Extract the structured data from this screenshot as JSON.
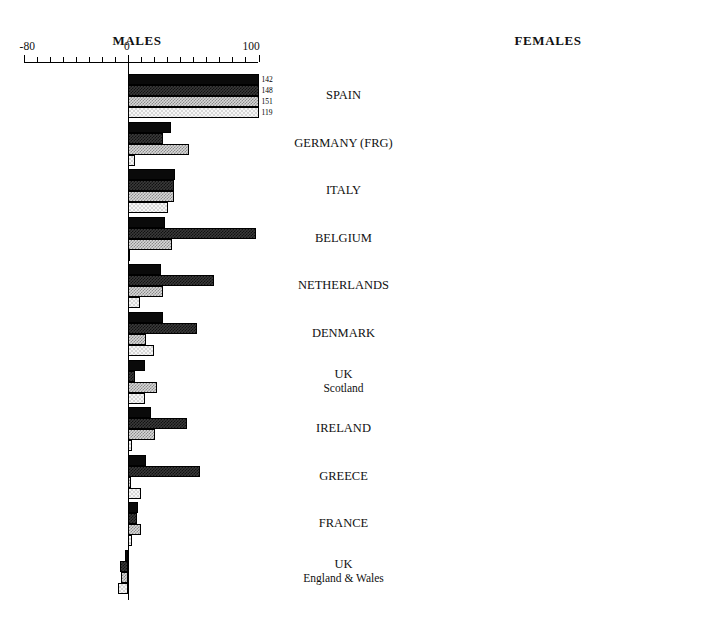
{
  "chart_data": {
    "type": "bar",
    "title": "",
    "orientation": "horizontal-diverging",
    "panels": [
      {
        "key": "males",
        "label": "MALES"
      },
      {
        "key": "females",
        "label": "FEMALES"
      }
    ],
    "xlabel": "",
    "ylabel": "",
    "xlim": [
      -80,
      100
    ],
    "xticks": [
      -80,
      -70,
      -60,
      -50,
      -40,
      -30,
      -20,
      -10,
      0,
      10,
      20,
      30,
      40,
      50,
      60,
      70,
      80,
      90,
      100
    ],
    "xtick_labels_shown": [
      "-80",
      "0",
      "100"
    ],
    "grid": false,
    "legend": "none",
    "series": [
      {
        "name": "series-1",
        "pattern": "solid-black"
      },
      {
        "name": "series-2",
        "pattern": "dark-crosshatch"
      },
      {
        "name": "series-3",
        "pattern": "mid-gray-checker"
      },
      {
        "name": "series-4",
        "pattern": "light-checker"
      }
    ],
    "categories": [
      "SPAIN",
      "GERMANY (FRG)",
      "ITALY",
      "BELGIUM",
      "NETHERLANDS",
      "DENMARK",
      "UK Scotland",
      "IRELAND",
      "GREECE",
      "FRANCE",
      "UK England & Wales"
    ],
    "males": {
      "values": [
        [
          142,
          148,
          151,
          119
        ],
        [
          33,
          27,
          47,
          5
        ],
        [
          36,
          35,
          35,
          31
        ],
        [
          28,
          98,
          34,
          1
        ],
        [
          25,
          66,
          27,
          9
        ],
        [
          27,
          53,
          14,
          20
        ],
        [
          13,
          5,
          22,
          13
        ],
        [
          18,
          45,
          21,
          3
        ],
        [
          14,
          55,
          2,
          10
        ],
        [
          8,
          7,
          10,
          3
        ],
        [
          -2,
          -6,
          -5,
          -8
        ]
      ],
      "clipped": [
        true,
        false,
        false,
        false,
        false,
        false,
        false,
        false,
        false,
        false,
        false
      ]
    },
    "females": {
      "values": [
        [
          200,
          144,
          209,
          202
        ],
        [
          28,
          38,
          28,
          20
        ],
        [
          33,
          18,
          45,
          22
        ],
        [
          30,
          -60,
          100,
          -20
        ],
        [
          3,
          -10,
          0,
          8
        ],
        [
          3,
          -5,
          20,
          -12
        ],
        [
          3,
          7,
          -1,
          -4
        ],
        [
          2,
          -8,
          30,
          -20
        ],
        [
          2,
          -18,
          23,
          -20
        ],
        [
          28,
          52,
          23,
          10
        ],
        [
          -6,
          -22,
          -7,
          -12
        ]
      ],
      "clipped": [
        true,
        false,
        false,
        false,
        false,
        false,
        false,
        false,
        false,
        false,
        false
      ]
    },
    "value_labels": {
      "males": [
        "142",
        "148",
        "151",
        "119"
      ],
      "females": [
        "200",
        "144",
        "209",
        "202"
      ]
    }
  },
  "countries": [
    {
      "main": "SPAIN",
      "sub": ""
    },
    {
      "main": "GERMANY (FRG)",
      "sub": ""
    },
    {
      "main": "ITALY",
      "sub": ""
    },
    {
      "main": "BELGIUM",
      "sub": ""
    },
    {
      "main": "NETHERLANDS",
      "sub": ""
    },
    {
      "main": "DENMARK",
      "sub": ""
    },
    {
      "main": "UK",
      "sub": "Scotland"
    },
    {
      "main": "IRELAND",
      "sub": ""
    },
    {
      "main": "GREECE",
      "sub": ""
    },
    {
      "main": "FRANCE",
      "sub": ""
    },
    {
      "main": "UK",
      "sub": "England & Wales"
    }
  ],
  "axis": {
    "left_label": "-80",
    "zero_label": "0",
    "right_label": "100"
  },
  "colors": {
    "ink": "#000000",
    "background": "#ffffff",
    "series_1": "#0a0a0a",
    "series_2": "#3a3a3a",
    "series_3": "#d8d8d8",
    "series_4": "#f6f6f6"
  }
}
